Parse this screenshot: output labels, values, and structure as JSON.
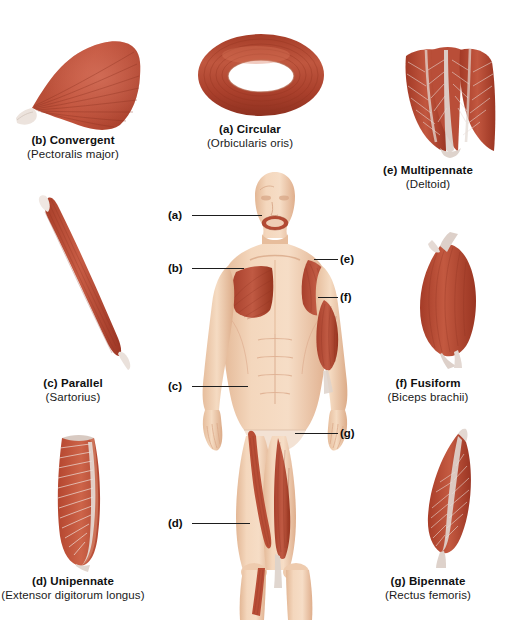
{
  "figure": {
    "palette": {
      "muscle_dark": "#a33726",
      "muscle_mid": "#bf5340",
      "muscle_light": "#d2775f",
      "tendon": "#e9e2de",
      "skin": "#f2d2b6",
      "skin_shadow": "#dfb293",
      "text": "#101010",
      "leader_line": "#1d1d1d"
    }
  },
  "panels": [
    {
      "key": "b",
      "title": "(b) Convergent",
      "subtitle": "(Pectoralis major)",
      "shape": "fan"
    },
    {
      "key": "a",
      "title": "(a) Circular",
      "subtitle": "(Orbicularis oris)",
      "shape": "ring"
    },
    {
      "key": "e",
      "title": "(e) Multipennate",
      "subtitle": "(Deltoid)",
      "shape": "multipennate"
    },
    {
      "key": "c",
      "title": "(c) Parallel",
      "subtitle": "(Sartorius)",
      "shape": "strap"
    },
    {
      "key": "f",
      "title": "(f) Fusiform",
      "subtitle": "(Biceps brachii)",
      "shape": "spindle"
    },
    {
      "key": "d",
      "title": "(d) Unipennate",
      "subtitle": "(Extensor digitorum longus)",
      "shape": "unipennate"
    },
    {
      "key": "g",
      "title": "(g) Bipennate",
      "subtitle": "(Rectus femoris)",
      "shape": "bipennate"
    }
  ],
  "callouts": [
    {
      "key": "a",
      "label": "(a)",
      "region": "orbicularis-oris"
    },
    {
      "key": "b",
      "label": "(b)",
      "region": "pectoralis-major"
    },
    {
      "key": "e",
      "label": "(e)",
      "region": "deltoid"
    },
    {
      "key": "f",
      "label": "(f)",
      "region": "biceps-brachii"
    },
    {
      "key": "c",
      "label": "(c)",
      "region": "sartorius"
    },
    {
      "key": "g",
      "label": "(g)",
      "region": "rectus-femoris"
    },
    {
      "key": "d",
      "label": "(d)",
      "region": "extensor-digitorum-longus"
    }
  ]
}
